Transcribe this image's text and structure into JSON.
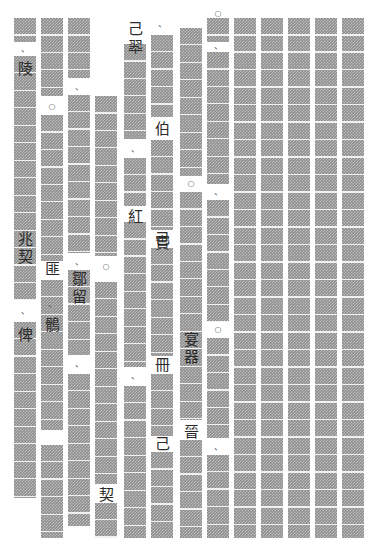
{
  "document": {
    "type": "redacted-vertical-text-page",
    "writing_mode": "vertical-rtl",
    "page_width": 385,
    "page_height": 546,
    "background_color": "#ffffff",
    "redaction_color": "#8e8e8e",
    "glyph_color": "#2b2b2b",
    "cell_size": 17.5,
    "column_count": 13,
    "columns": [
      {
        "name": "column-1",
        "x": 14,
        "width": 22,
        "redactions": [
          {
            "top": 18,
            "height": 24
          },
          {
            "top": 56,
            "height": 244
          },
          {
            "top": 322,
            "height": 176
          }
        ],
        "glyphs": [
          {
            "top": 45,
            "text": "、",
            "kind": "mark"
          },
          {
            "top": 62,
            "text": "陵",
            "kind": "cjk"
          },
          {
            "top": 232,
            "text": "兆",
            "kind": "cjk"
          },
          {
            "top": 250,
            "text": "契",
            "kind": "cjk"
          },
          {
            "top": 307,
            "text": "、",
            "kind": "mark"
          },
          {
            "top": 328,
            "text": "俾",
            "kind": "cjk"
          }
        ]
      },
      {
        "name": "column-2",
        "x": 41,
        "width": 22,
        "redactions": [
          {
            "top": 18,
            "height": 78
          },
          {
            "top": 115,
            "height": 146
          },
          {
            "top": 280,
            "height": 150
          },
          {
            "top": 445,
            "height": 93
          }
        ],
        "glyphs": [
          {
            "top": 103,
            "text": "○",
            "kind": "circle"
          },
          {
            "top": 262,
            "text": "匪",
            "kind": "cjk"
          },
          {
            "top": 300,
            "text": "、",
            "kind": "mark"
          },
          {
            "top": 318,
            "text": "鶻",
            "kind": "cjk"
          }
        ]
      },
      {
        "name": "column-3",
        "x": 68,
        "width": 22,
        "redactions": [
          {
            "top": 18,
            "height": 60
          },
          {
            "top": 95,
            "height": 158
          },
          {
            "top": 270,
            "height": 85
          },
          {
            "top": 374,
            "height": 152
          }
        ],
        "glyphs": [
          {
            "top": 83,
            "text": "、",
            "kind": "mark"
          },
          {
            "top": 258,
            "text": "、",
            "kind": "mark"
          },
          {
            "top": 272,
            "text": "鄒",
            "kind": "cjk"
          },
          {
            "top": 290,
            "text": "留",
            "kind": "cjk"
          },
          {
            "top": 360,
            "text": "、",
            "kind": "mark"
          }
        ]
      },
      {
        "name": "column-4",
        "x": 95,
        "width": 22,
        "redactions": [
          {
            "top": 96,
            "height": 160
          },
          {
            "top": 282,
            "height": 202
          },
          {
            "top": 503,
            "height": 35
          }
        ],
        "glyphs": [
          {
            "top": 263,
            "text": "○",
            "kind": "circle"
          },
          {
            "top": 488,
            "text": "契",
            "kind": "cjk"
          }
        ]
      },
      {
        "name": "column-5",
        "x": 124,
        "width": 22,
        "redactions": [
          {
            "top": 44,
            "height": 95
          },
          {
            "top": 158,
            "height": 48
          },
          {
            "top": 222,
            "height": 145
          },
          {
            "top": 386,
            "height": 152
          }
        ],
        "glyphs": [
          {
            "top": 22,
            "text": "己",
            "kind": "cjk"
          },
          {
            "top": 40,
            "text": "翆",
            "kind": "cjk"
          },
          {
            "top": 145,
            "text": "、",
            "kind": "mark"
          },
          {
            "top": 210,
            "text": "紅",
            "kind": "cjk"
          },
          {
            "top": 372,
            "text": "、",
            "kind": "mark"
          }
        ]
      },
      {
        "name": "column-6",
        "x": 151,
        "width": 22,
        "redactions": [
          {
            "top": 35,
            "height": 82
          },
          {
            "top": 140,
            "height": 90
          },
          {
            "top": 248,
            "height": 108
          },
          {
            "top": 374,
            "height": 62
          },
          {
            "top": 452,
            "height": 86
          }
        ],
        "glyphs": [
          {
            "top": 20,
            "text": "、",
            "kind": "mark"
          },
          {
            "top": 122,
            "text": "伯",
            "kind": "cjk"
          },
          {
            "top": 232,
            "text": "己",
            "kind": "cjk"
          },
          {
            "top": 236,
            "text": "實",
            "kind": "cjk"
          },
          {
            "top": 358,
            "text": "冊",
            "kind": "cjk"
          },
          {
            "top": 437,
            "text": "己",
            "kind": "cjk"
          }
        ]
      },
      {
        "name": "column-7",
        "x": 180,
        "width": 22,
        "redactions": [
          {
            "top": 28,
            "height": 148
          },
          {
            "top": 192,
            "height": 228
          },
          {
            "top": 440,
            "height": 98
          }
        ],
        "glyphs": [
          {
            "top": 180,
            "text": "○",
            "kind": "circle"
          },
          {
            "top": 333,
            "text": "宴",
            "kind": "cjk"
          },
          {
            "top": 350,
            "text": "器",
            "kind": "cjk"
          },
          {
            "top": 425,
            "text": "晉",
            "kind": "cjk"
          }
        ]
      },
      {
        "name": "column-8",
        "x": 207,
        "width": 22,
        "redactions": [
          {
            "top": 18,
            "height": 24
          },
          {
            "top": 52,
            "height": 132
          },
          {
            "top": 200,
            "height": 122
          },
          {
            "top": 338,
            "height": 100
          },
          {
            "top": 455,
            "height": 83
          }
        ],
        "glyphs": [
          {
            "top": 10,
            "text": "○",
            "kind": "circle"
          },
          {
            "top": 42,
            "text": "、",
            "kind": "mark"
          },
          {
            "top": 188,
            "text": "、",
            "kind": "mark"
          },
          {
            "top": 326,
            "text": "○",
            "kind": "circle"
          },
          {
            "top": 443,
            "text": "、",
            "kind": "mark"
          }
        ]
      },
      {
        "name": "column-9",
        "x": 234,
        "width": 22,
        "redactions": [
          {
            "top": 18,
            "height": 520
          }
        ],
        "glyphs": []
      },
      {
        "name": "column-10",
        "x": 261,
        "width": 22,
        "redactions": [
          {
            "top": 18,
            "height": 520
          }
        ],
        "glyphs": []
      },
      {
        "name": "column-11",
        "x": 288,
        "width": 22,
        "redactions": [
          {
            "top": 18,
            "height": 520
          }
        ],
        "glyphs": []
      },
      {
        "name": "column-12",
        "x": 315,
        "width": 22,
        "redactions": [
          {
            "top": 18,
            "height": 520
          }
        ],
        "glyphs": []
      },
      {
        "name": "column-13",
        "x": 342,
        "width": 22,
        "redactions": [
          {
            "top": 18,
            "height": 520
          }
        ],
        "glyphs": []
      }
    ]
  }
}
